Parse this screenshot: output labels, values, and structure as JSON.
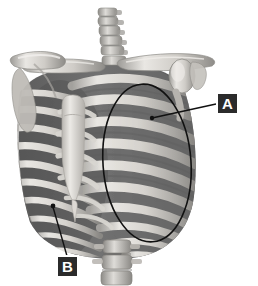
{
  "figure": {
    "background_color": "#ffffff",
    "width": 258,
    "height": 286
  },
  "palette": {
    "bone_light": "#e6e4e0",
    "bone_mid": "#c9c6c1",
    "bone_shadow": "#8f8d89",
    "cavity_dark": "#6a6a6a",
    "cavity_darker": "#565656",
    "rib_highlight": "#dcdad6",
    "marker_fill": "#2b2b2b",
    "marker_text": "#ffffff",
    "leader_line": "#111111",
    "outline_ellipse": "#111111"
  },
  "markers": [
    {
      "id": "A",
      "label": "A",
      "box": {
        "x": 216,
        "y": 92,
        "w": 23,
        "h": 23
      },
      "leader": {
        "from_x": 216,
        "from_y": 104,
        "to_x": 152,
        "to_y": 118
      },
      "target_dot": {
        "x": 152,
        "y": 118,
        "r": 2.2
      },
      "points_to": "rib-body"
    },
    {
      "id": "B",
      "label": "B",
      "box": {
        "x": 56,
        "y": 255,
        "w": 23,
        "h": 23
      },
      "leader": {
        "from_x": 67,
        "from_y": 255,
        "to_x": 53,
        "to_y": 207
      },
      "target_dot": {
        "x": 53,
        "y": 206,
        "r": 2.4
      },
      "points_to": "lower-rib-lateral"
    }
  ],
  "annotations": {
    "ellipse": {
      "name": "region-outline-ellipse",
      "cx": 147,
      "cy": 163,
      "rx": 44,
      "ry": 79,
      "rotate_deg": -4,
      "stroke": "#111111",
      "stroke_width": 1.6,
      "fill": "none"
    }
  },
  "anatomy": {
    "structures": [
      "cervical-vertebrae",
      "clavicle-left",
      "clavicle-right",
      "scapula-left",
      "humerus-head-right",
      "sternum",
      "xiphoid-process",
      "ribs",
      "costal-cartilage",
      "lumbar-vertebrae"
    ],
    "rib_count_visible": 10
  }
}
